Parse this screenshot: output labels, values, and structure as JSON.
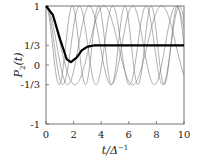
{
  "chart_data": {
    "type": "line",
    "title": "",
    "xlabel": "t/Δ⁻¹",
    "ylabel": "P₂(t)",
    "xlim": [
      0,
      10
    ],
    "ylim": [
      -1,
      1
    ],
    "xticks": [
      "0",
      "2",
      "4",
      "6",
      "8",
      "10"
    ],
    "yticks": [
      "1",
      "1/3",
      "0",
      "-1/3",
      "-1"
    ],
    "grid": false,
    "series": [
      {
        "name": "oscillation ω=1.5",
        "style": "thin gray",
        "formula": "1/3 + 2/3 cos(1.5 t)"
      },
      {
        "name": "oscillation ω=2.0",
        "style": "thin gray",
        "formula": "1/3 + 2/3 cos(2.0 t)"
      },
      {
        "name": "oscillation ω=2.6",
        "style": "thin gray",
        "formula": "1/3 + 2/3 cos(2.6 t)"
      },
      {
        "name": "oscillation ω=3.3",
        "style": "thin gray",
        "formula": "1/3 + 2/3 cos(3.3 t)"
      },
      {
        "name": "average",
        "style": "thick black",
        "x": [
          0,
          0.5,
          1.0,
          1.5,
          1.8,
          2.2,
          2.6,
          3.0,
          3.5,
          4,
          6,
          8,
          10
        ],
        "values": [
          1.0,
          0.85,
          0.45,
          0.1,
          0.05,
          0.12,
          0.25,
          0.31,
          0.333,
          0.333,
          0.333,
          0.333,
          0.333
        ]
      }
    ]
  },
  "axes": {
    "xlabel": "t/Δ",
    "xlabel_sup": "−1",
    "ylabel": "P",
    "ylabel_sub": "2",
    "ylabel_arg": "(t)",
    "xticks": [
      "0",
      "2",
      "4",
      "6",
      "8",
      "10"
    ],
    "yticks": [
      "1",
      "1/3",
      "0",
      "-1/3",
      "-1"
    ]
  }
}
